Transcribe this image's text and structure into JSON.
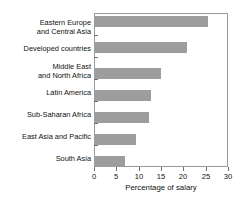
{
  "chart_data": {
    "type": "bar",
    "orientation": "horizontal",
    "title": "",
    "xlabel": "Percentage of salary",
    "ylabel": "",
    "xlim": [
      0,
      30
    ],
    "xticks": [
      0,
      5,
      10,
      15,
      20,
      25,
      30
    ],
    "grid": false,
    "legend": false,
    "bar_color": "#9d9d9d",
    "categories": [
      "Eastern Europe\nand Central Asia",
      "Developed countries",
      "Middle East\nand North Africa",
      "Latin America",
      "Sub-Saharan Africa",
      "East Asia and Pacific",
      "South Asia"
    ],
    "values": [
      25.5,
      20.8,
      15.0,
      12.7,
      12.3,
      9.4,
      6.9
    ]
  },
  "axis": {
    "x_title": "Percentage of salary",
    "tick_labels": [
      "0",
      "5",
      "10",
      "15",
      "20",
      "25",
      "30"
    ]
  }
}
